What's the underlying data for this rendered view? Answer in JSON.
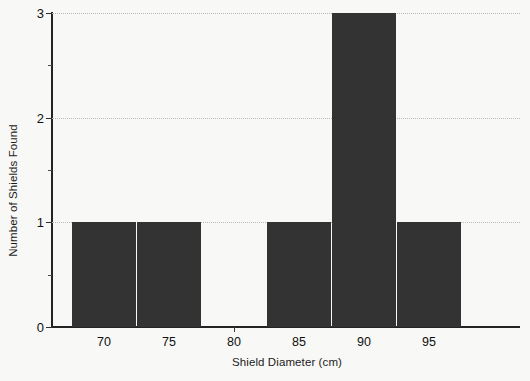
{
  "chart_data": {
    "type": "bar",
    "title": "",
    "subtitle": "",
    "xlabel": "Shield Diameter (cm)",
    "ylabel": "Number of Shields Found",
    "categories": [
      "70",
      "75",
      "80",
      "85",
      "90",
      "95"
    ],
    "values": [
      1,
      1,
      0,
      1,
      3,
      1
    ],
    "bin_width": 5,
    "bin_edges": [
      67.5,
      72.5,
      77.5,
      82.5,
      87.5,
      92.5,
      97.5
    ],
    "xlim": [
      66,
      102
    ],
    "ylim": [
      0,
      3
    ],
    "x_tick_labels": [
      "70",
      "75",
      "80",
      "85",
      "90",
      "95"
    ],
    "x_tick_values": [
      70,
      75,
      80,
      85,
      95,
      95
    ],
    "y_tick_labels": [
      "0",
      "1",
      "2",
      "3"
    ],
    "y_tick_values": [
      0,
      1,
      2,
      3
    ],
    "y_minor_ticks": [
      0.5,
      1.5,
      2.5
    ],
    "grid": "horizontal-dotted",
    "gridlines_at": [
      1,
      2,
      3
    ],
    "legend": null,
    "legend_position": "none",
    "bar_color": "#333333",
    "background_color": "#f8f8f6",
    "axis_color": "#242424",
    "gridline_color": "#b9b9b9",
    "total_count": 7
  }
}
